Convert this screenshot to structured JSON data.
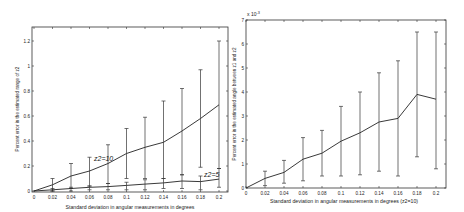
{
  "chart_data": [
    {
      "type": "line",
      "title": "",
      "xlabel": "Standard deviation in angular measurements in degrees",
      "ylabel": "Percent error in the estimated range of z2",
      "xlim": [
        0,
        0.2
      ],
      "ylim": [
        0,
        1.3
      ],
      "x_ticks": [
        "0",
        "0.02",
        "0.04",
        "0.06",
        "0.08",
        "0.1",
        "0.12",
        "0.14",
        "0.16",
        "0.18",
        "0.2"
      ],
      "y_ticks": [
        "0",
        "0.2",
        "0.4",
        "0.6",
        "0.8",
        "1",
        "1.2"
      ],
      "grid": false,
      "legend": "none (inline annotations)",
      "x": [
        0,
        0.02,
        0.04,
        0.06,
        0.08,
        0.1,
        0.12,
        0.14,
        0.16,
        0.18,
        0.2
      ],
      "series": [
        {
          "name": "z2=10",
          "annotation": "z2=10",
          "values": [
            0,
            0.05,
            0.12,
            0.16,
            0.22,
            0.3,
            0.35,
            0.39,
            0.48,
            0.58,
            0.69
          ],
          "error_low": [
            0,
            0.0,
            0.02,
            0.04,
            0.06,
            0.1,
            0.1,
            0.1,
            0.13,
            0.19,
            0.18
          ],
          "error_high": [
            0,
            0.1,
            0.22,
            0.27,
            0.37,
            0.5,
            0.59,
            0.72,
            0.82,
            0.97,
            1.2
          ]
        },
        {
          "name": "z2=5",
          "annotation": "z2=5",
          "values": [
            0,
            0.01,
            0.02,
            0.03,
            0.035,
            0.045,
            0.055,
            0.065,
            0.08,
            0.075,
            0.095
          ],
          "error_low": [
            0,
            0.0,
            0.0,
            0.01,
            0.01,
            0.01,
            0.01,
            0.02,
            0.02,
            0.01,
            0.03
          ],
          "error_high": [
            0,
            0.02,
            0.03,
            0.04,
            0.06,
            0.07,
            0.09,
            0.1,
            0.13,
            0.12,
            0.18
          ]
        }
      ]
    },
    {
      "type": "line",
      "title": "",
      "xlabel": "Standard deviation in angular measurements in degrees (z2=10)",
      "ylabel": "Percent error in the estimated angle between z1 and z2",
      "y_scale_label": "x 10⁻³",
      "xlim": [
        0,
        0.2
      ],
      "ylim": [
        0,
        7
      ],
      "x_ticks": [
        "0",
        "0.02",
        "0.04",
        "0.06",
        "0.08",
        "0.1",
        "0.12",
        "0.14",
        "0.16",
        "0.18",
        "0.2"
      ],
      "y_ticks": [
        "0",
        "1",
        "2",
        "3",
        "4",
        "5",
        "6",
        "7"
      ],
      "grid": false,
      "legend": "none",
      "x": [
        0,
        0.02,
        0.04,
        0.06,
        0.08,
        0.1,
        0.12,
        0.14,
        0.16,
        0.18,
        0.2
      ],
      "series": [
        {
          "name": "angle error (z2=10)",
          "values": [
            0,
            0.4,
            0.65,
            1.2,
            1.45,
            1.95,
            2.3,
            2.75,
            2.9,
            3.9,
            3.7
          ],
          "error_low": [
            0,
            0.1,
            0.2,
            0.3,
            0.5,
            0.5,
            0.55,
            0.7,
            0.5,
            1.3,
            0.8
          ],
          "error_high": [
            0,
            0.7,
            1.15,
            2.1,
            2.4,
            3.4,
            4.0,
            4.8,
            5.3,
            6.5,
            6.5
          ]
        }
      ]
    }
  ],
  "left_chart": {
    "xlabel": "Standard deviation in angular measurements in degrees",
    "ylabel": "Percent error in the estimated range of z2",
    "annotation_a": "z2=10",
    "annotation_b": "z2=5"
  },
  "right_chart": {
    "xlabel": "Standard deviation in angular measurements in degrees (z2=10)",
    "ylabel": "Percent error in the estimated angle between z1 and z2",
    "scale_label": "x 10",
    "scale_exp": "-3"
  }
}
